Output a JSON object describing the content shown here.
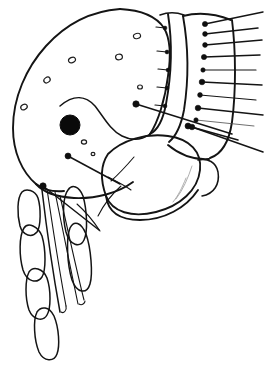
{
  "figure": {
    "view": "lateral",
    "orientation": "head at left, thorax at right",
    "background_color": "#ffffff",
    "ink_color": "#141414",
    "canvas": {
      "width": 267,
      "height": 366
    },
    "label_text": ""
  },
  "parts": {
    "head_capsule": {
      "name": "head-capsule",
      "description": "Large rounded head outline occupying left half of figure",
      "outline_path": "M 118 10 C 86 12 58 28 38 54 C 18 80 10 112 14 140 C 17 166 28 184 40 190 L 64 192 C 88 192 110 186 126 176 C 142 166 152 152 156 138"
    },
    "eye": {
      "name": "eye",
      "shape": "filled-circle",
      "center_x": 70,
      "center_y": 125,
      "radius": 10,
      "color": "#0a0a0a"
    },
    "setal_pits": {
      "name": "setal-pits",
      "shape": "small-ovals",
      "count": 8,
      "positions": [
        {
          "cx": 24,
          "cy": 107,
          "rx": 3.4,
          "ry": 2.6,
          "rot": -30
        },
        {
          "cx": 47,
          "cy": 80,
          "rx": 3.4,
          "ry": 2.6,
          "rot": -35
        },
        {
          "cx": 72,
          "cy": 60,
          "rx": 3.6,
          "ry": 2.6,
          "rot": -25
        },
        {
          "cx": 119,
          "cy": 57,
          "rx": 3.4,
          "ry": 2.8,
          "rot": -10
        },
        {
          "cx": 137,
          "cy": 36,
          "rx": 3.6,
          "ry": 2.6,
          "rot": -15
        },
        {
          "cx": 140,
          "cy": 87,
          "rx": 2.4,
          "ry": 2.0,
          "rot": 0
        },
        {
          "cx": 84,
          "cy": 142,
          "rx": 2.6,
          "ry": 2.1,
          "rot": 0
        },
        {
          "cx": 93,
          "cy": 154,
          "rx": 1.9,
          "ry": 1.6,
          "rot": 0
        }
      ]
    },
    "pronotum": {
      "name": "pronotum",
      "description": "First thoracic segment bearing a row of short bristles",
      "bristle_count": 5
    },
    "mesothorax": {
      "name": "mesothorax",
      "description": "Second thoracic segment with long marginal bristle row",
      "bristle_count": 10
    },
    "maxillary_palp": {
      "name": "maxillary-palp",
      "segment_count": 5,
      "description": "Five elongate segments directed ventrally from head"
    },
    "stylets": {
      "name": "stylets",
      "count": 3,
      "description": "Slender piercing mouthpart blades"
    },
    "coxa": {
      "name": "fore-coxa",
      "description": "Broad rounded leg base below thorax"
    },
    "long_setae": {
      "name": "long-setae",
      "count": 4,
      "description": "Long bristles with bulbous bases crossing the body"
    }
  },
  "geometry": {
    "head_outline": "M 120 9 C 92 11 66 24 46 46 C 26 68 13 98 13 128 C 13 152 22 172 36 184 C 44 190 54 192 64 191",
    "head_ventral": "M 36 184 C 44 193 58 197 74 198 C 96 199 118 193 133 182",
    "frontal_ridge": "M 60 106 C 74 94 86 96 95 106 C 103 116 110 130 122 136 C 132 141 142 140 150 134",
    "head_back_edge": "M 120 9 C 140 10 156 16 164 28 C 170 38 171 56 168 76 C 165 100 158 122 150 134",
    "pronotum_front": "M 168 14 C 172 40 172 72 166 104 C 163 120 158 130 150 134",
    "pronotum_back": "M 183 16 C 188 44 189 78 184 110 C 181 126 176 136 169 142",
    "meso_front": "M 183 16 C 188 44 189 78 184 110 C 181 126 176 136 169 142",
    "meso_back": "M 232 20 C 236 52 236 92 232 122 C 229 142 222 154 210 158",
    "thorax_top": "M 163 14 C 180 12 206 14 232 20",
    "thorax_bottom": "M 169 142 C 180 152 196 158 210 158",
    "coxa_outline": "M 108 154 C 122 140 146 133 168 136 C 190 139 202 152 200 170 C 198 190 180 206 156 212 C 132 218 112 212 106 196 C 101 182 100 166 108 154",
    "coxa_lower": "M 106 196 C 108 212 120 220 140 220 C 164 220 186 208 198 190",
    "trochanter": "M 198 160 C 208 158 216 162 218 172 C 220 184 214 194 202 196",
    "femur_hint": "M 200 170 C 206 182 208 192 204 200"
  },
  "bristles": {
    "pronotal_row": [
      {
        "x1": 165,
        "y1": 28,
        "x2": 156,
        "y2": 27,
        "bulb": 1.9
      },
      {
        "x1": 167,
        "y1": 52,
        "x2": 157,
        "y2": 51,
        "bulb": 1.9
      },
      {
        "x1": 168,
        "y1": 70,
        "x2": 158,
        "y2": 69,
        "bulb": 1.9
      },
      {
        "x1": 167,
        "y1": 88,
        "x2": 157,
        "y2": 87,
        "bulb": 1.9
      },
      {
        "x1": 165,
        "y1": 106,
        "x2": 155,
        "y2": 105,
        "bulb": 1.9
      }
    ],
    "mesothoracic_row": [
      {
        "x1": 205,
        "y1": 24,
        "x2": 263,
        "y2": 12,
        "bulb": 2.6
      },
      {
        "x1": 205,
        "y1": 34,
        "x2": 258,
        "y2": 28,
        "bulb": 2.4
      },
      {
        "x1": 205,
        "y1": 45,
        "x2": 262,
        "y2": 40,
        "bulb": 2.4
      },
      {
        "x1": 204,
        "y1": 57,
        "x2": 260,
        "y2": 55,
        "bulb": 2.6
      },
      {
        "x1": 203,
        "y1": 70,
        "x2": 256,
        "y2": 70,
        "bulb": 2.2
      },
      {
        "x1": 202,
        "y1": 82,
        "x2": 262,
        "y2": 85,
        "bulb": 2.8
      },
      {
        "x1": 200,
        "y1": 95,
        "x2": 256,
        "y2": 100,
        "bulb": 2.4
      },
      {
        "x1": 198,
        "y1": 108,
        "x2": 263,
        "y2": 115,
        "bulb": 2.8
      },
      {
        "x1": 196,
        "y1": 120,
        "x2": 254,
        "y2": 126,
        "bulb": 2.2
      },
      {
        "x1": 192,
        "y1": 127,
        "x2": 263,
        "y2": 152,
        "bulb": 2.8
      }
    ],
    "long_setae": [
      {
        "x1": 136,
        "y1": 104,
        "x2": 232,
        "y2": 134,
        "bulb": 3.2
      },
      {
        "x1": 188,
        "y1": 126,
        "x2": 238,
        "y2": 140,
        "bulb": 3.0
      },
      {
        "x1": 68,
        "y1": 156,
        "x2": 120,
        "y2": 184,
        "bulb": 3.0
      },
      {
        "x1": 43,
        "y1": 186,
        "x2": 99,
        "y2": 230,
        "bulb": 3.2
      }
    ],
    "head_hairs": [
      {
        "x1": 111,
        "y1": 182,
        "x2": 96,
        "y2": 218
      },
      {
        "x1": 121,
        "y1": 176,
        "x2": 112,
        "y2": 206
      }
    ]
  },
  "palp_segments": [
    {
      "index": 1,
      "path": "M 22 192 C 17 198 17 214 20 226 C 23 236 32 238 37 232 C 41 226 41 208 38 198 C 35 190 26 188 22 192"
    },
    {
      "index": 2,
      "path": "M 24 228 C 19 236 19 256 23 270 C 27 282 37 284 42 277 C 46 270 46 250 42 236 C 38 226 28 222 24 228"
    },
    {
      "index": 3,
      "path": "M 29 272 C 25 280 25 298 29 310 C 33 320 43 322 47 315 C 51 308 51 290 47 278 C 43 268 33 266 29 272"
    },
    {
      "index": 4,
      "path": "M 37 312 C 33 320 34 340 39 352 C 44 362 54 362 57 354 C 60 346 59 328 54 316 C 49 306 41 306 37 312"
    },
    {
      "index": 5,
      "path": "M 68 190 C 63 196 62 216 66 232 C 70 246 80 248 84 240 C 88 232 87 210 83 196 C 79 186 72 184 68 190"
    }
  ],
  "palp_segments_right": [
    {
      "index": 1,
      "path": "M 70 228 C 66 238 67 264 72 280 C 77 294 87 294 90 284 C 93 274 91 248 86 234 C 81 222 74 220 70 228"
    }
  ],
  "stylet_paths": [
    "M 42 190 C 46 224 52 268 60 312",
    "M 47 189 C 52 222 58 264 66 306",
    "M 55 192 C 62 226 70 266 78 304",
    "M 60 196 C 68 230 76 268 84 300"
  ],
  "annotations": {
    "scale_bar": "",
    "figure_number": "",
    "caption": ""
  }
}
